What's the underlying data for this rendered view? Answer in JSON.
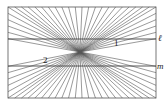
{
  "figure": {
    "type": "hering-illusion",
    "frame": {
      "x1": 8,
      "y1": 7,
      "x2": 156,
      "y2": 98
    },
    "center": {
      "x": 80,
      "y": 52
    },
    "ray_count_per_side": 22,
    "line_color": "#555555",
    "parallel_lines": [
      {
        "name": "ell",
        "y": 39,
        "label": "ℓ"
      },
      {
        "name": "m",
        "y": 66,
        "label": "m"
      }
    ],
    "angle_labels": [
      {
        "id": "1",
        "text": "1",
        "x": 114,
        "y": 39
      },
      {
        "id": "2",
        "text": "2",
        "x": 43,
        "y": 56
      }
    ]
  }
}
